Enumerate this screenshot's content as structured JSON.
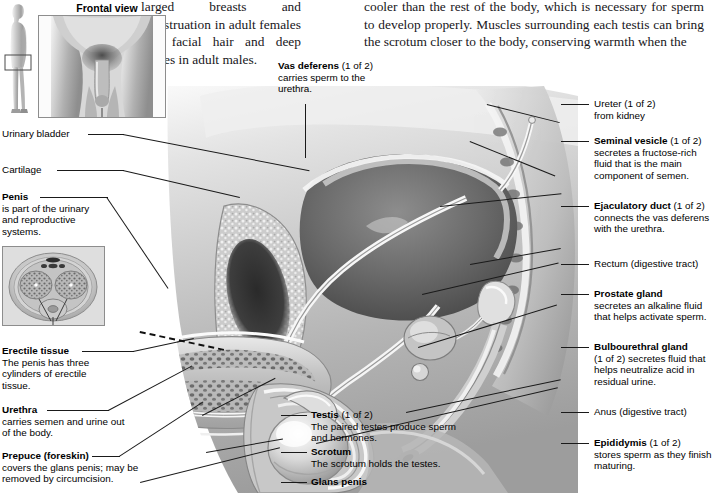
{
  "page": {
    "background_color": "#ffffff",
    "text_color": "#17161a",
    "leader_line_color": "#1a1a1a"
  },
  "body_text": {
    "left_column": "larged breasts and menstruation in adult females and facial hair and deep voices in adult males.",
    "right_column": "cooler than the rest of the body, which is necessary for sperm to develop properly. Muscles surrounding each testis can bring the scrotum closer to the body, conserving warmth when the"
  },
  "insets": {
    "body_figure": {
      "name": "standing-male-side-view",
      "highlight_box": true
    },
    "frontal_view": {
      "caption": "Frontal view"
    },
    "cross_section": {
      "name": "penis-cross-section"
    }
  },
  "labels": {
    "vas_deferens": {
      "term": "Vas deferens",
      "qualifier": "(1 of 2)",
      "description": "carries sperm to the urethra."
    },
    "ureter": {
      "term": "Ureter",
      "qualifier": "(1 of 2)",
      "description": "from kidney",
      "bold": false
    },
    "seminal_vesicle": {
      "term": "Seminal vesicle",
      "qualifier": "(1 of 2)",
      "description": "secretes a fructose-rich fluid that is the main component of semen."
    },
    "ejaculatory_duct": {
      "term": "Ejaculatory duct",
      "qualifier": "(1 of 2)",
      "description": "connects the vas deferens with the urethra."
    },
    "rectum": {
      "term": "Rectum (digestive tract)",
      "qualifier": "",
      "description": "",
      "bold": false
    },
    "prostate_gland": {
      "term": "Prostate gland",
      "qualifier": "",
      "description": "secretes an alkaline fluid that helps activate sperm."
    },
    "bulbourethral_gland": {
      "term": "Bulbourethral gland",
      "qualifier": "",
      "description": "(1 of 2) secretes fluid that helps neutralize acid in residual urine."
    },
    "anus": {
      "term": "Anus (digestive tract)",
      "qualifier": "",
      "description": "",
      "bold": false
    },
    "epididymis": {
      "term": "Epididymis",
      "qualifier": "(1 of 2)",
      "description": "stores sperm as they finish maturing."
    },
    "urinary_bladder": {
      "term": "Urinary bladder",
      "qualifier": "",
      "description": "",
      "bold": false
    },
    "cartilage": {
      "term": "Cartilage",
      "qualifier": "",
      "description": "",
      "bold": false
    },
    "penis": {
      "term": "Penis",
      "qualifier": "",
      "description": "is part of the urinary and reproductive systems."
    },
    "erectile_tissue": {
      "term": "Erectile tissue",
      "qualifier": "",
      "description": "The penis has three cylinders of erectile tissue."
    },
    "urethra": {
      "term": "Urethra",
      "qualifier": "",
      "description": "carries semen and urine out of the body."
    },
    "prepuce": {
      "term": "Prepuce (foreskin)",
      "qualifier": "",
      "description": "covers the glans penis; may be removed by circumcision."
    },
    "testis": {
      "term": "Testis",
      "qualifier": "(1 of 2)",
      "description": "The paired testes produce sperm and hormones."
    },
    "scrotum": {
      "term": "Scrotum",
      "qualifier": "",
      "description": "The scrotum holds the testes."
    },
    "glans_penis": {
      "term": "Glans penis",
      "qualifier": "",
      "description": ""
    }
  }
}
